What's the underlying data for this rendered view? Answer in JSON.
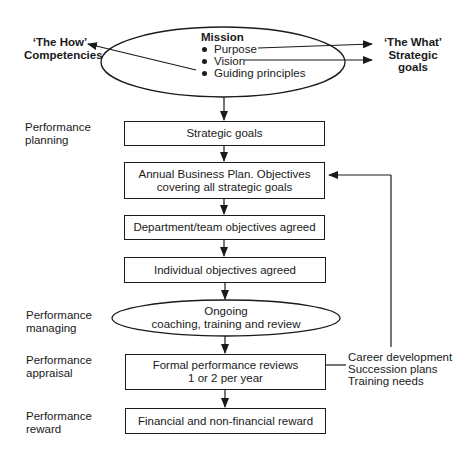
{
  "mission": {
    "title": "Mission",
    "items": [
      "Purpose",
      "Vision",
      "Guiding principles"
    ]
  },
  "left_callout": {
    "line1": "‘The How’",
    "line2": "Competencies"
  },
  "right_callout": {
    "line1": "‘The What’",
    "line2": "Strategic",
    "line3": "goals"
  },
  "stages": {
    "planning": {
      "line1": "Performance",
      "line2": "planning"
    },
    "managing": {
      "line1": "Performance",
      "line2": "managing"
    },
    "appraisal": {
      "line1": "Performance",
      "line2": "appraisal"
    },
    "reward": {
      "line1": "Performance",
      "line2": "reward"
    }
  },
  "boxes": {
    "strategic_goals": {
      "line1": "Strategic goals"
    },
    "annual_plan": {
      "line1": "Annual Business Plan. Objectives",
      "line2": "covering all strategic goals"
    },
    "department": {
      "line1": "Department/team objectives agreed"
    },
    "individual": {
      "line1": "Individual objectives agreed"
    },
    "ongoing": {
      "line1": "Ongoing",
      "line2": "coaching, training and review"
    },
    "formal_reviews": {
      "line1": "Formal performance reviews",
      "line2": "1 or 2 per year"
    },
    "reward": {
      "line1": "Financial and non-financial reward"
    }
  },
  "feedback": {
    "items": [
      "Career development",
      "Succession plans",
      "Training needs"
    ]
  },
  "colors": {
    "stroke": "#1a1a1a",
    "background": "#ffffff"
  }
}
